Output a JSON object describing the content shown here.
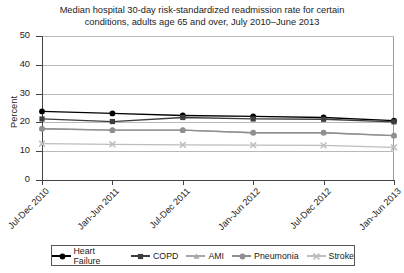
{
  "chart_data": {
    "type": "line",
    "title": "Median hospital 30-day risk-standardized readmission rate for certain conditions, adults age 65 and over, July 2010–June 2013",
    "title_line1": "Median hospital 30-day risk-standardized readmission rate for certain",
    "title_line2": "conditions, adults age 65 and over, July 2010–June 2013",
    "xlabel": "",
    "ylabel": "Percent",
    "ylim": [
      0,
      50
    ],
    "yticks": [
      0,
      10,
      20,
      30,
      40,
      50
    ],
    "grid": true,
    "legend_position": "bottom",
    "categories": [
      "Jul-Dec 2010",
      "Jan-Jun 2011",
      "Jul-Dec 2011",
      "Jan-Jun 2012",
      "Jul-Dec 2012",
      "Jan-Jun 2013"
    ],
    "series": [
      {
        "name": "Heart Failure",
        "color": "#000000",
        "marker": "circle",
        "values": [
          23.8,
          23.1,
          22.4,
          22.1,
          21.7,
          20.6
        ]
      },
      {
        "name": "COPD",
        "color": "#3d3d3d",
        "marker": "square",
        "values": [
          21.2,
          20.3,
          21.7,
          21.2,
          21.1,
          20.2
        ]
      },
      {
        "name": "AMI",
        "color": "#a7a7a7",
        "marker": "triangle",
        "values": [
          17.8,
          17.3,
          17.3,
          16.4,
          16.4,
          15.4
        ]
      },
      {
        "name": "Pneumonia",
        "color": "#8f8f8f",
        "marker": "circle",
        "values": [
          17.8,
          17.3,
          17.3,
          16.4,
          16.4,
          15.4
        ]
      },
      {
        "name": "Stroke",
        "color": "#bdbdbd",
        "marker": "x",
        "values": [
          12.6,
          12.4,
          12.2,
          12.1,
          12.0,
          11.3
        ]
      }
    ]
  },
  "legend": {
    "items": [
      {
        "label": "Heart Failure"
      },
      {
        "label": "COPD"
      },
      {
        "label": "AMI"
      },
      {
        "label": "Pneumonia"
      },
      {
        "label": "Stroke"
      }
    ]
  }
}
